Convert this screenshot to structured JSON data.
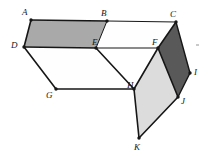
{
  "figure": {
    "background_color": "#ffffff",
    "stroke_color": "#161616",
    "label_color": "#171717",
    "colors": {
      "face_dark": "#595959",
      "face_medium": "#a9a9a9",
      "face_light": "#dcdcdc",
      "face_white": "#fefefe",
      "stroke": "#161616",
      "dot": "#161616"
    },
    "vertices": [
      {
        "id": "A",
        "label": "A",
        "x": 31,
        "y": 20,
        "label_x": 22,
        "label_y": 8,
        "dot": true
      },
      {
        "id": "B",
        "label": "B",
        "x": 107,
        "y": 21,
        "label_x": 101,
        "label_y": 9,
        "dot": true
      },
      {
        "id": "C",
        "label": "C",
        "x": 176,
        "y": 22,
        "label_x": 170,
        "label_y": 10,
        "dot": true
      },
      {
        "id": "D",
        "label": "D",
        "x": 24,
        "y": 47,
        "label_x": 11,
        "label_y": 41,
        "dot": true
      },
      {
        "id": "E",
        "label": "E",
        "x": 96,
        "y": 48,
        "label_x": 92,
        "label_y": 38,
        "dot": true
      },
      {
        "id": "F",
        "label": "F",
        "x": 158,
        "y": 48,
        "label_x": 152,
        "label_y": 38,
        "dot": true
      },
      {
        "id": "G",
        "label": "G",
        "x": 56,
        "y": 89,
        "label_x": 46,
        "label_y": 91,
        "dot": true
      },
      {
        "id": "H",
        "label": "H",
        "x": 134,
        "y": 89,
        "label_x": 127,
        "label_y": 81,
        "dot": true
      },
      {
        "id": "I",
        "label": "I",
        "x": 190,
        "y": 73,
        "label_x": 194,
        "label_y": 68,
        "dot": true
      },
      {
        "id": "J",
        "label": "J",
        "x": 178,
        "y": 97,
        "label_x": 181,
        "label_y": 97,
        "dot": true
      },
      {
        "id": "K",
        "label": "K",
        "x": 139,
        "y": 138,
        "label_x": 134,
        "label_y": 143,
        "dot": true
      }
    ],
    "faces": [
      {
        "name": "face-ABED",
        "vertices": "A,B,E,D",
        "fill": "#a9a9a9",
        "shading": "medium-gray"
      },
      {
        "name": "face-BCFE",
        "vertices": "B,C,F,E",
        "fill": "#fefefe",
        "shading": "white"
      },
      {
        "name": "face-DEHG",
        "vertices": "D,E,H,G",
        "fill": "#fefefe",
        "shading": "white"
      },
      {
        "name": "face-CFJI",
        "vertices": "C,F,J,I",
        "fill": "#595959",
        "shading": "dark-gray"
      },
      {
        "name": "face-FHKJ",
        "vertices": "F,H,K,J",
        "fill": "#dcdcdc",
        "shading": "light-gray"
      }
    ],
    "edges": [
      {
        "name": "edge-AB",
        "from": "A",
        "to": "B",
        "weight": 1.6
      },
      {
        "name": "edge-BC",
        "from": "B",
        "to": "C",
        "weight": 1.0
      },
      {
        "name": "edge-AD",
        "from": "A",
        "to": "D",
        "weight": 1.6
      },
      {
        "name": "edge-DE",
        "from": "D",
        "to": "E",
        "weight": 1.6
      },
      {
        "name": "edge-BE",
        "from": "B",
        "to": "E",
        "weight": 1.0
      },
      {
        "name": "edge-EF",
        "from": "E",
        "to": "F",
        "weight": 1.0
      },
      {
        "name": "edge-CF",
        "from": "C",
        "to": "F",
        "weight": 1.6
      },
      {
        "name": "edge-DG",
        "from": "D",
        "to": "G",
        "weight": 1.6
      },
      {
        "name": "edge-GH",
        "from": "G",
        "to": "H",
        "weight": 1.6
      },
      {
        "name": "edge-EH",
        "from": "E",
        "to": "H",
        "weight": 1.6
      },
      {
        "name": "edge-CI",
        "from": "C",
        "to": "I",
        "weight": 1.4
      },
      {
        "name": "edge-IJ",
        "from": "I",
        "to": "J",
        "weight": 1.4
      },
      {
        "name": "edge-FJ",
        "from": "F",
        "to": "J",
        "weight": 1.6
      },
      {
        "name": "edge-FH",
        "from": "F",
        "to": "H",
        "weight": 1.6
      },
      {
        "name": "edge-HK",
        "from": "H",
        "to": "K",
        "weight": 1.6
      },
      {
        "name": "edge-JK",
        "from": "J",
        "to": "K",
        "weight": 1.6
      }
    ],
    "artifacts": [
      {
        "name": "speck-right-margin",
        "x": 196,
        "y": 44
      }
    ]
  }
}
